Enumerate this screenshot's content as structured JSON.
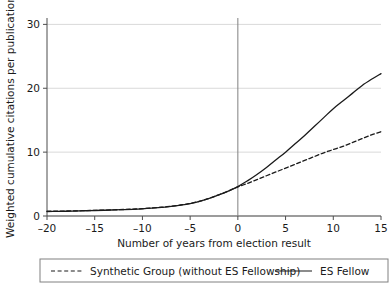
{
  "chart_data": {
    "type": "line",
    "title": "",
    "xlabel": "Number of years from election result",
    "ylabel": "Weighted cumulative citations per publication",
    "xlim": [
      -20,
      15
    ],
    "ylim": [
      0,
      31
    ],
    "xticks": [
      -20,
      -15,
      -10,
      -5,
      0,
      5,
      10,
      15
    ],
    "xtick_labels": [
      "–20",
      "–15",
      "–10",
      "–5",
      "0",
      "5",
      "10",
      "15"
    ],
    "yticks": [
      0,
      10,
      20,
      30
    ],
    "ytick_labels": [
      "0",
      "10",
      "20",
      "30"
    ],
    "grid": "horizontal",
    "legend_position": "bottom",
    "reference_line_x": 0,
    "x": [
      -20,
      -19,
      -18,
      -17,
      -16,
      -15,
      -14,
      -13,
      -12,
      -11,
      -10,
      -9,
      -8,
      -7,
      -6,
      -5,
      -4,
      -3,
      -2,
      -1,
      0,
      1,
      2,
      3,
      4,
      5,
      6,
      7,
      8,
      9,
      10,
      11,
      12,
      13,
      14,
      15
    ],
    "series": [
      {
        "name": "ES Fellow",
        "style": "solid",
        "color": "#1a1a1a",
        "values": [
          0.7,
          0.72,
          0.74,
          0.78,
          0.82,
          0.86,
          0.9,
          0.95,
          1.0,
          1.05,
          1.12,
          1.22,
          1.35,
          1.5,
          1.7,
          1.95,
          2.3,
          2.75,
          3.3,
          3.9,
          4.6,
          5.5,
          6.5,
          7.6,
          8.8,
          10.0,
          11.3,
          12.6,
          14.0,
          15.4,
          16.8,
          18.0,
          19.2,
          20.4,
          21.4,
          22.3
        ]
      },
      {
        "name": "Synthetic Group (without ES Fellowship)",
        "style": "dashed",
        "color": "#1a1a1a",
        "values": [
          0.75,
          0.76,
          0.78,
          0.8,
          0.84,
          0.88,
          0.92,
          0.96,
          1.02,
          1.08,
          1.15,
          1.25,
          1.38,
          1.52,
          1.72,
          1.97,
          2.32,
          2.77,
          3.32,
          3.92,
          4.55,
          5.1,
          5.7,
          6.3,
          6.9,
          7.5,
          8.1,
          8.7,
          9.3,
          9.9,
          10.4,
          10.9,
          11.5,
          12.1,
          12.7,
          13.2
        ]
      }
    ]
  },
  "legend": {
    "entries": [
      {
        "label": "Synthetic Group (without ES Fellowship)",
        "style": "dashed"
      },
      {
        "label": "ES Fellow",
        "style": "solid"
      }
    ]
  },
  "colors": {
    "line": "#1a1a1a",
    "grid": "#d9d9d9",
    "axis": "#4d4d4d",
    "reference_line": "#808080",
    "legend_border": "#808080",
    "background": "#ffffff"
  }
}
